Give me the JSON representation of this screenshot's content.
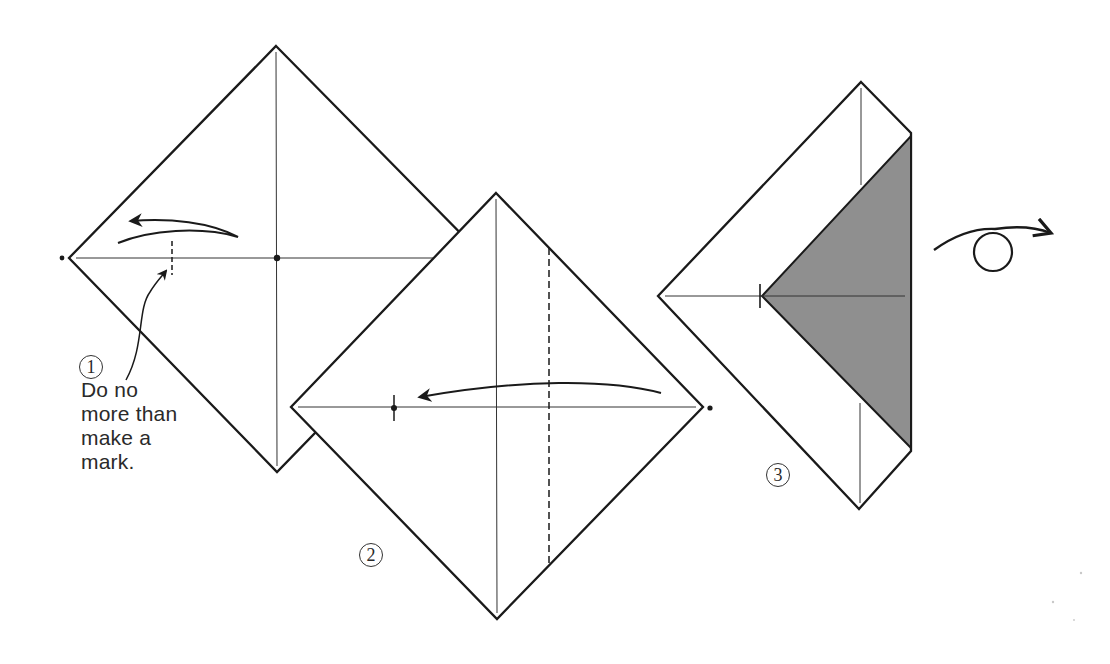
{
  "figure": {
    "colors": {
      "line": "#1a1a1a",
      "shade": "#8f8f8f",
      "background": "#ffffff",
      "text": "#2a2a2a"
    }
  },
  "steps": [
    {
      "number": "1",
      "label": "①",
      "note_lines": [
        "Do no",
        "more than",
        "make a",
        "mark."
      ],
      "action": "Fold left corner toward center only to pinch a mark"
    },
    {
      "number": "2",
      "label": "②",
      "action": "Fold right corner to the mark"
    },
    {
      "number": "3",
      "label": "③",
      "action": "Turn the model over",
      "symbol": "turn-over"
    }
  ]
}
